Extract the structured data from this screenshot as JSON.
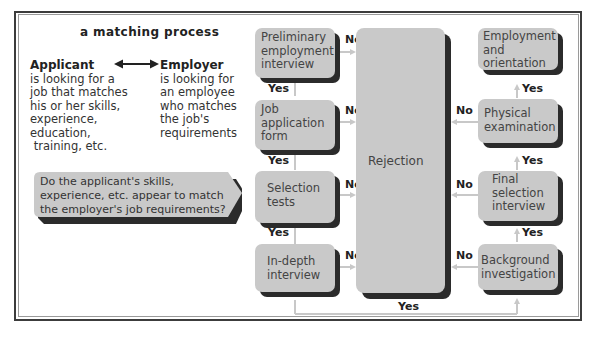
{
  "title": "a matching process",
  "applicant": {
    "heading": "Applicant",
    "body": "is looking for a\njob that matches\nhis or her skills,\nexperience,\neducation,\n training, etc."
  },
  "employer": {
    "heading": "Employer",
    "body": "is looking for\nan employee\nwho matches\nthe job's\nrequirements"
  },
  "question": "Do the applicant's skills,\nexperience, etc. appear to match\nthe employer's job requirements?",
  "left_steps": [
    {
      "label": "Preliminary\nemployment\ninterview",
      "no": "No",
      "yes": "Yes"
    },
    {
      "label": "Job\napplication\nform",
      "no": "No",
      "yes": "Yes"
    },
    {
      "label": "Selection\ntests",
      "no": "No",
      "yes": "Yes"
    },
    {
      "label": "In-depth\ninterview",
      "no": "No",
      "yes": "Yes"
    }
  ],
  "rejection": "Rejection",
  "right_steps": [
    {
      "label": "Employment\nand\norientation"
    },
    {
      "label": "Physical\nexamination",
      "no": "No",
      "yes": "Yes"
    },
    {
      "label": "Final\nselection\ninterview",
      "no": "No",
      "yes": "Yes"
    },
    {
      "label": "Background\ninvestigation",
      "no": "No",
      "yes": "Yes"
    }
  ],
  "colors": {
    "box_fill": "#c9c9c9",
    "box_shadow": "#2b2b2b",
    "connector": "#c8c8c8",
    "frame": "#3c3c3c"
  }
}
